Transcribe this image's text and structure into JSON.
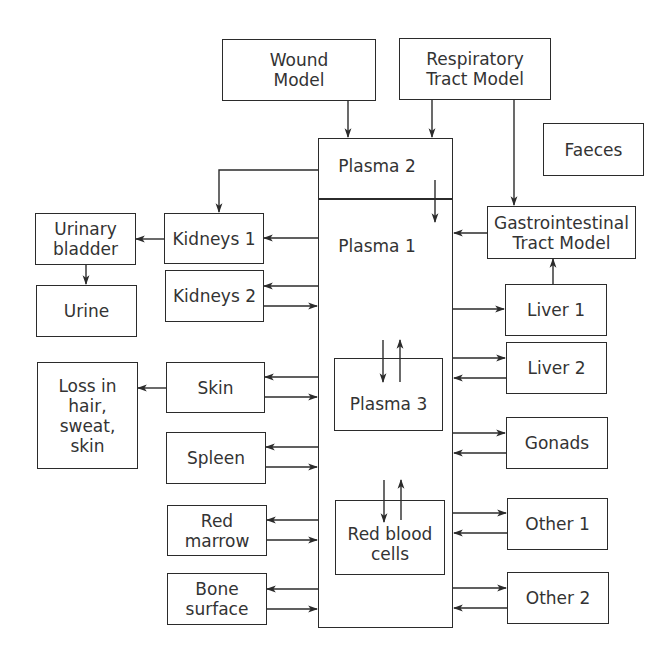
{
  "diagram": {
    "type": "compartment-model",
    "boxes": {
      "wound": "Wound\nModel",
      "respiratory": "Respiratory\nTract Model",
      "faeces": "Faeces",
      "gi_tract": "Gastrointestinal\nTract Model",
      "plasma2": "Plasma 2",
      "plasma1": "Plasma 1",
      "plasma3": "Plasma 3",
      "rbc": "Red blood\ncells",
      "kidneys1": "Kidneys 1",
      "kidneys2": "Kidneys 2",
      "urinary_bladder": "Urinary\nbladder",
      "urine": "Urine",
      "skin": "Skin",
      "loss": "Loss in\nhair,\nsweat,\nskin",
      "spleen": "Spleen",
      "red_marrow": "Red\nmarrow",
      "bone_surface": "Bone\nsurface",
      "liver1": "Liver 1",
      "liver2": "Liver 2",
      "gonads": "Gonads",
      "other1": "Other 1",
      "other2": "Other 2"
    },
    "edges": [
      [
        "Wound Model",
        "Plasma 2"
      ],
      [
        "Respiratory Tract Model",
        "Plasma 2"
      ],
      [
        "Respiratory Tract Model",
        "Gastrointestinal Tract Model"
      ],
      [
        "Plasma 2",
        "Plasma 1"
      ],
      [
        "Plasma 2",
        "Kidneys 1"
      ],
      [
        "Gastrointestinal Tract Model",
        "Plasma 1"
      ],
      [
        "Liver 1",
        "Gastrointestinal Tract Model"
      ],
      [
        "Plasma 1",
        "Kidneys 1"
      ],
      [
        "Kidneys 1",
        "Urinary bladder"
      ],
      [
        "Urinary bladder",
        "Urine"
      ],
      [
        "Plasma 1",
        "Kidneys 2"
      ],
      [
        "Kidneys 2",
        "Plasma 1"
      ],
      [
        "Plasma 1",
        "Skin"
      ],
      [
        "Skin",
        "Plasma 1"
      ],
      [
        "Skin",
        "Loss in hair, sweat, skin"
      ],
      [
        "Plasma 1",
        "Spleen"
      ],
      [
        "Spleen",
        "Plasma 1"
      ],
      [
        "Plasma 1",
        "Red marrow"
      ],
      [
        "Red marrow",
        "Plasma 1"
      ],
      [
        "Plasma 1",
        "Bone surface"
      ],
      [
        "Bone surface",
        "Plasma 1"
      ],
      [
        "Plasma 1",
        "Plasma 3"
      ],
      [
        "Plasma 3",
        "Plasma 1"
      ],
      [
        "Plasma 1",
        "Red blood cells"
      ],
      [
        "Red blood cells",
        "Plasma 1"
      ],
      [
        "Plasma 1",
        "Liver 1"
      ],
      [
        "Plasma 1",
        "Liver 2"
      ],
      [
        "Liver 2",
        "Plasma 1"
      ],
      [
        "Plasma 1",
        "Gonads"
      ],
      [
        "Gonads",
        "Plasma 1"
      ],
      [
        "Plasma 1",
        "Other 1"
      ],
      [
        "Other 1",
        "Plasma 1"
      ],
      [
        "Plasma 1",
        "Other 2"
      ],
      [
        "Other 2",
        "Plasma 1"
      ]
    ]
  }
}
